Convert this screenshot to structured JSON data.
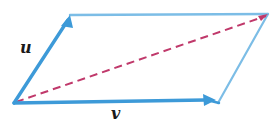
{
  "figure": {
    "background_color": "#ffffff",
    "width": 276,
    "height": 126
  },
  "labels": {
    "u": "u",
    "v": "v"
  },
  "colors": {
    "vector_blue": "#3d9ad8",
    "edge_blue": "#7cbde6",
    "diagonal_red": "#c0396b",
    "label_black": "#1a1a1a"
  },
  "geometry": {
    "origin": {
      "x": 14,
      "y": 103
    },
    "u_tip": {
      "x": 70,
      "y": 15
    },
    "v_tip": {
      "x": 215,
      "y": 100
    },
    "opposite_corner": {
      "x": 268,
      "y": 14
    },
    "bottom_right_corner": {
      "x": 218,
      "y": 103
    }
  },
  "elements": {
    "vector_u_name": "vector-u",
    "vector_v_name": "vector-v",
    "diagonal_name": "diagonal-sum-vector",
    "top_edge_name": "parallelogram-top-edge",
    "right_edge_name": "parallelogram-right-edge"
  }
}
